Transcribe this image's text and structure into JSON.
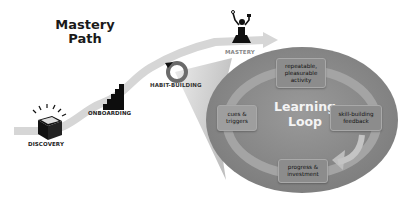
{
  "title": {
    "line1": "Mastery",
    "line2": "Path"
  },
  "path_stages": [
    {
      "label": "DISCOVERY",
      "icon": "open-box-icon"
    },
    {
      "label": "ONBOARDING",
      "icon": "stairs-icon"
    },
    {
      "label": "HABIT-BUILDING",
      "icon": "circular-arrow-icon"
    },
    {
      "label": "MASTERY",
      "icon": "victory-figure-icon"
    }
  ],
  "loop": {
    "title_line1": "Learning",
    "title_line2": "Loop",
    "steps": [
      {
        "line1": "repeatable,",
        "line2": "pleasurable",
        "line3": "activity"
      },
      {
        "line1": "skill-building",
        "line2": "feedback"
      },
      {
        "line1": "progress &",
        "line2": "investment"
      },
      {
        "line1": "cues &",
        "line2": "triggers"
      }
    ]
  },
  "colors": {
    "path": "#d6d6d6",
    "loop_fill": "#8f8f8f",
    "loop_ring": "#a6a6a6",
    "callout": "#c8c8c8",
    "box_fill": "#8c8c8c",
    "icon": "#111111",
    "habit_icon": "#6e6e6e"
  }
}
